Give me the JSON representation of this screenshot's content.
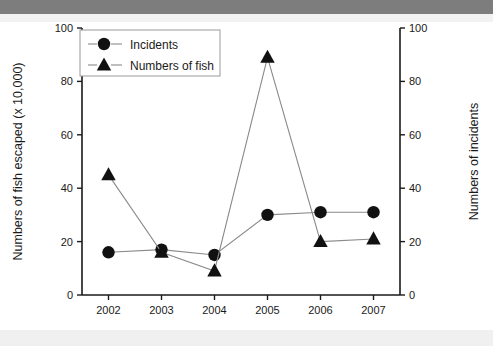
{
  "chart_data": {
    "type": "line",
    "title": "",
    "xlabel": "",
    "categories": [
      "2002",
      "2003",
      "2004",
      "2005",
      "2006",
      "2007"
    ],
    "x": [
      2002,
      2003,
      2004,
      2005,
      2006,
      2007
    ],
    "grid": false,
    "legend_position": "top-left",
    "left_axis": {
      "label": "Numbers of fish escaped (x 10,000)",
      "ylim": [
        0,
        100
      ],
      "ticks": [
        0,
        20,
        40,
        60,
        80,
        100
      ],
      "tick_labels": [
        "0",
        "20",
        "40",
        "60",
        "80",
        "100"
      ]
    },
    "right_axis": {
      "label": "Numbers of incidents",
      "ylim": [
        0,
        100
      ],
      "ticks": [
        0,
        20,
        40,
        60,
        80,
        100
      ],
      "tick_labels": [
        "0",
        "20",
        "40",
        "60",
        "80",
        "100"
      ]
    },
    "series": [
      {
        "name": "Incidents",
        "marker": "circle",
        "axis": "right",
        "color": "#111111",
        "line_color": "#8a8a8a",
        "values": [
          16,
          17,
          15,
          30,
          31,
          31
        ]
      },
      {
        "name": "Numbers of fish",
        "marker": "triangle",
        "axis": "left",
        "color": "#111111",
        "line_color": "#8a8a8a",
        "values": [
          45,
          16,
          9,
          89,
          20,
          21
        ]
      }
    ]
  },
  "legend": {
    "entries": [
      {
        "label": "Incidents",
        "marker": "circle"
      },
      {
        "label": "Numbers of fish",
        "marker": "triangle"
      }
    ]
  },
  "colors": {
    "marker": "#111111",
    "line": "#8a8a8a",
    "axis": "#1a1a1a",
    "band_top": "#7d7d7d",
    "band_bottom": "#f0f0f0"
  }
}
